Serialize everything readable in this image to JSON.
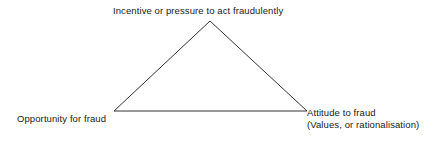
{
  "diagram": {
    "name": "fraud-triangle",
    "background_color": "#ffffff",
    "stroke_color": "#333333",
    "stroke_width": 1,
    "shape": {
      "type": "triangle",
      "vertices": {
        "apex": {
          "x": 210,
          "y": 21
        },
        "bottom_left": {
          "x": 114,
          "y": 111
        },
        "bottom_right": {
          "x": 307,
          "y": 111
        }
      }
    },
    "labels": {
      "apex": "Incentive or pressure to act fraudulently",
      "bottom_left": "Opportunity for fraud",
      "bottom_right_line1": "Attitude to fraud",
      "bottom_right_line2": "(Values, or rationalisation)"
    }
  }
}
